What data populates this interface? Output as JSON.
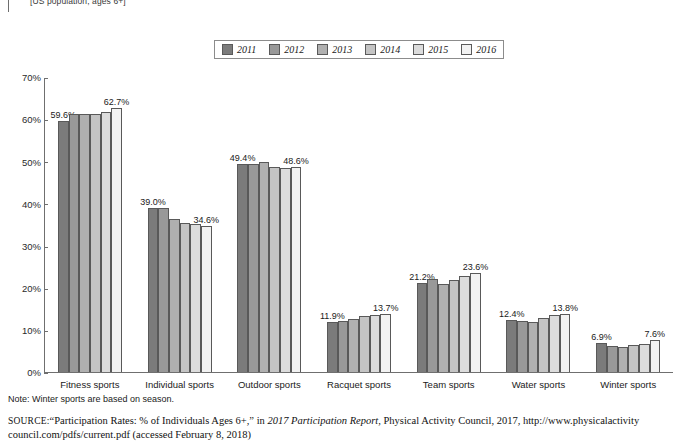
{
  "caption": {
    "top": "[US population, ages 6+]"
  },
  "legend": {
    "items": [
      {
        "label": "2011",
        "color": "#7b7b7b"
      },
      {
        "label": "2012",
        "color": "#999999"
      },
      {
        "label": "2013",
        "color": "#b0b0b0"
      },
      {
        "label": "2014",
        "color": "#c4c4c4"
      },
      {
        "label": "2015",
        "color": "#dcdcdc"
      },
      {
        "label": "2016",
        "color": "#f2f2f2"
      }
    ]
  },
  "axis": {
    "y_ticks": [
      "0%",
      "10%",
      "20%",
      "30%",
      "40%",
      "50%",
      "60%",
      "70%"
    ]
  },
  "footer": {
    "note": "Note: Winter sports are based on season.",
    "source_label": "SOURCE:",
    "source_part1": "“Participation Rates: % of Individuals Ages 6+,” in ",
    "source_italic": "2017 Participation Report",
    "source_part2": ", Physical Activity Council, 2017, http://www.physicalactivity council.com/pdfs/current.pdf (accessed February 8, 2018)"
  },
  "chart_data": {
    "type": "bar",
    "title": "",
    "subtitle": "[US population, ages 6+]",
    "xlabel": "",
    "ylabel": "",
    "ylim": [
      0,
      70
    ],
    "ytick_values": [
      0,
      10,
      20,
      30,
      40,
      50,
      60,
      70
    ],
    "grid": false,
    "legend_position": "top-center",
    "value_label_suffix": "%",
    "categories": [
      "Fitness sports",
      "Individual sports",
      "Outdoor sports",
      "Racquet sports",
      "Team sports",
      "Water sports",
      "Winter sports"
    ],
    "series": [
      {
        "name": "2011",
        "color": "#7b7b7b",
        "values": [
          59.6,
          39.0,
          49.4,
          11.9,
          21.2,
          12.4,
          6.9
        ]
      },
      {
        "name": "2012",
        "color": "#999999",
        "values": [
          61.2,
          39.0,
          49.4,
          12.1,
          22.0,
          12.1,
          6.2
        ]
      },
      {
        "name": "2013",
        "color": "#b0b0b0",
        "values": [
          61.3,
          36.3,
          49.8,
          12.5,
          21.0,
          11.9,
          6.0
        ]
      },
      {
        "name": "2014",
        "color": "#c4c4c4",
        "values": [
          61.3,
          35.4,
          48.7,
          13.4,
          21.9,
          12.8,
          6.5
        ]
      },
      {
        "name": "2015",
        "color": "#dcdcdc",
        "values": [
          61.6,
          35.2,
          48.4,
          13.5,
          22.8,
          13.6,
          6.7
        ]
      },
      {
        "name": "2016",
        "color": "#f2f2f2",
        "values": [
          62.7,
          34.6,
          48.6,
          13.7,
          23.6,
          13.8,
          7.6
        ]
      }
    ],
    "labeled_points": [
      {
        "category": "Fitness sports",
        "series": "2011",
        "label": "59.6%"
      },
      {
        "category": "Fitness sports",
        "series": "2016",
        "label": "62.7%"
      },
      {
        "category": "Individual sports",
        "series": "2011",
        "label": "39.0%"
      },
      {
        "category": "Individual sports",
        "series": "2016",
        "label": "34.6%"
      },
      {
        "category": "Outdoor sports",
        "series": "2011",
        "label": "49.4%"
      },
      {
        "category": "Outdoor sports",
        "series": "2016",
        "label": "48.6%"
      },
      {
        "category": "Racquet sports",
        "series": "2011",
        "label": "11.9%"
      },
      {
        "category": "Racquet sports",
        "series": "2016",
        "label": "13.7%"
      },
      {
        "category": "Team sports",
        "series": "2011",
        "label": "21.2%"
      },
      {
        "category": "Team sports",
        "series": "2016",
        "label": "23.6%"
      },
      {
        "category": "Water sports",
        "series": "2011",
        "label": "12.4%"
      },
      {
        "category": "Water sports",
        "series": "2016",
        "label": "13.8%"
      },
      {
        "category": "Winter sports",
        "series": "2011",
        "label": "6.9%"
      },
      {
        "category": "Winter sports",
        "series": "2016",
        "label": "7.6%"
      }
    ]
  }
}
